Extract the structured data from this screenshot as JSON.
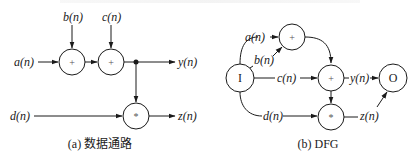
{
  "datapath": {
    "caption": "(a) 数据通路",
    "inputs": {
      "a": "a(n)",
      "b": "b(n)",
      "c": "c(n)",
      "d": "d(n)"
    },
    "outputs": {
      "y": "y(n)",
      "z": "z(n)"
    },
    "nodes": [
      {
        "id": "add1",
        "op": "+"
      },
      {
        "id": "add2",
        "op": "+"
      },
      {
        "id": "mul",
        "op": "*"
      }
    ]
  },
  "dfg": {
    "caption": "(b) DFG",
    "input_node": "I",
    "output_node": "O",
    "edges": {
      "a": "a(n)",
      "b": "b(n)",
      "c": "c(n)",
      "d": "d(n)",
      "y": "y(n)",
      "z": "z(n)"
    },
    "nodes": [
      {
        "id": "add1",
        "op": "+"
      },
      {
        "id": "add2",
        "op": "+"
      },
      {
        "id": "mul",
        "op": "*"
      }
    ]
  }
}
